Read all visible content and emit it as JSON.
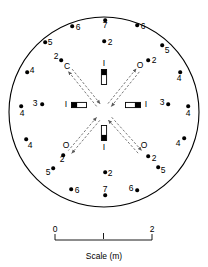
{
  "figure": {
    "type": "circular-array-layout-diagram",
    "outline": {
      "shape": "circle",
      "cx": 104,
      "cy": 112,
      "r": 95,
      "stroke": "#000000",
      "stroke_width": 1.1,
      "fill": "#ffffff"
    }
  },
  "perimeter_points": [
    {
      "id": "p01",
      "label": "6",
      "lx": 78,
      "ly": 27,
      "dx": 72,
      "dy": 26
    },
    {
      "id": "p02",
      "label": "7",
      "lx": 105,
      "ly": 25,
      "dx": 105,
      "dy": 20
    },
    {
      "id": "p03",
      "label": "6",
      "lx": 143,
      "ly": 26,
      "dx": 137,
      "dy": 25
    },
    {
      "id": "p04",
      "label": "2",
      "lx": 110,
      "ly": 42,
      "dx": 104,
      "dy": 41
    },
    {
      "id": "p05",
      "label": "5",
      "lx": 50,
      "ly": 42,
      "dx": 45,
      "dy": 42
    },
    {
      "id": "p06",
      "label": "5",
      "lx": 167,
      "ly": 50,
      "dx": 162,
      "dy": 45
    },
    {
      "id": "p07",
      "label": "2",
      "lx": 56,
      "ly": 56,
      "dx": 61,
      "dy": 60
    },
    {
      "id": "p08",
      "label": "2",
      "lx": 154,
      "ly": 60,
      "dx": 148,
      "dy": 60
    },
    {
      "id": "p09",
      "label": "4",
      "lx": 32,
      "ly": 70,
      "dx": 27,
      "dy": 72
    },
    {
      "id": "p10",
      "label": "4",
      "lx": 179,
      "ly": 78,
      "dx": 180,
      "dy": 72
    },
    {
      "id": "p11",
      "label": "3",
      "lx": 35,
      "ly": 103,
      "dx": 42,
      "dy": 104
    },
    {
      "id": "p12",
      "label": "3",
      "lx": 162,
      "ly": 102,
      "dx": 168,
      "dy": 104
    },
    {
      "id": "p13",
      "label": "4",
      "lx": 22,
      "ly": 113,
      "dx": 21,
      "dy": 106
    },
    {
      "id": "p14",
      "label": "4",
      "lx": 188,
      "ly": 113,
      "dx": 188,
      "dy": 106
    },
    {
      "id": "p15",
      "label": "4",
      "lx": 30,
      "ly": 145,
      "dx": 26,
      "dy": 139
    },
    {
      "id": "p16",
      "label": "4",
      "lx": 178,
      "ly": 143,
      "dx": 184,
      "dy": 138
    },
    {
      "id": "p17",
      "label": "2",
      "lx": 62,
      "ly": 159,
      "dx": 63,
      "dy": 155
    },
    {
      "id": "p18",
      "label": "2",
      "lx": 154,
      "ly": 158,
      "dx": 148,
      "dy": 156
    },
    {
      "id": "p19",
      "label": "5",
      "lx": 48,
      "ly": 172,
      "dx": 53,
      "dy": 168
    },
    {
      "id": "p20",
      "label": "5",
      "lx": 163,
      "ly": 170,
      "dx": 158,
      "dy": 167
    },
    {
      "id": "p21",
      "label": "2",
      "lx": 110,
      "ly": 173,
      "dx": 105,
      "dy": 172
    },
    {
      "id": "p22",
      "label": "6",
      "lx": 77,
      "ly": 190,
      "dx": 71,
      "dy": 189
    },
    {
      "id": "p23",
      "label": "7",
      "lx": 105,
      "ly": 189,
      "dx": 105,
      "dy": 195
    },
    {
      "id": "p24",
      "label": "6",
      "lx": 131,
      "ly": 188,
      "dx": 137,
      "dy": 190
    }
  ],
  "radial_arrows": [
    {
      "id": "a-nw",
      "label": "C",
      "x1": 104,
      "y1": 112,
      "x2": 70,
      "y2": 70,
      "lx": 67,
      "ly": 66
    },
    {
      "id": "a-ne",
      "label": "O",
      "x1": 104,
      "y1": 112,
      "x2": 138,
      "y2": 70,
      "lx": 140,
      "ly": 65
    },
    {
      "id": "a-sw",
      "label": "O",
      "x1": 104,
      "y1": 112,
      "x2": 70,
      "y2": 152,
      "lx": 66,
      "ly": 145
    },
    {
      "id": "a-se",
      "label": "O",
      "x1": 104,
      "y1": 112,
      "x2": 140,
      "y2": 152,
      "lx": 144,
      "ly": 145
    }
  ],
  "axial_markers": [
    {
      "id": "m-top",
      "label": "I",
      "orient": "vertical",
      "cx": 104,
      "cy": 77,
      "lx": 104,
      "ly": 63
    },
    {
      "id": "m-bottom",
      "label": "I",
      "orient": "vertical",
      "cx": 104,
      "cy": 133,
      "lx": 104,
      "ly": 147
    },
    {
      "id": "m-left",
      "label": "I",
      "orient": "horizontal",
      "cx": 79,
      "cy": 105,
      "lx": 66,
      "ly": 104
    },
    {
      "id": "m-right",
      "label": "I",
      "orient": "horizontal",
      "cx": 133,
      "cy": 105,
      "lx": 146,
      "ly": 104
    }
  ],
  "scale_bar": {
    "caption": "Scale (m)",
    "left_label": "0",
    "right_label": "2",
    "x_left": 55,
    "x_right": 152,
    "y": 240,
    "caption_x": 104,
    "caption_y": 256
  }
}
